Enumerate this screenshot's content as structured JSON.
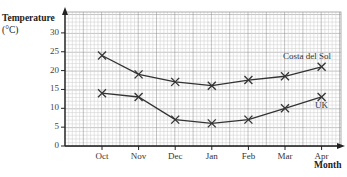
{
  "chart_data": {
    "type": "line",
    "title": "",
    "xlabel": "Month",
    "ylabel": "Temperature (°C)",
    "ylabel_line1": "Temperature",
    "ylabel_line2": "(°C)",
    "categories": [
      "Oct",
      "Nov",
      "Dec",
      "Jan",
      "Feb",
      "Mar",
      "Apr"
    ],
    "ylim": [
      0,
      33
    ],
    "yticks": [
      0,
      5,
      10,
      15,
      20,
      25,
      30
    ],
    "grid": true,
    "marker": "x",
    "series": [
      {
        "name": "Costa del Sol",
        "values": [
          24,
          19,
          17,
          16,
          17.5,
          18.5,
          21
        ]
      },
      {
        "name": "UK",
        "values": [
          14,
          13,
          7,
          6,
          7,
          10,
          13
        ]
      }
    ],
    "legend_position": "inline labels near right end of each line"
  },
  "colors": {
    "line": "#333333",
    "grid_minor": "#d4d4d4",
    "grid_major": "#9a9a9a",
    "axis": "#222222"
  }
}
